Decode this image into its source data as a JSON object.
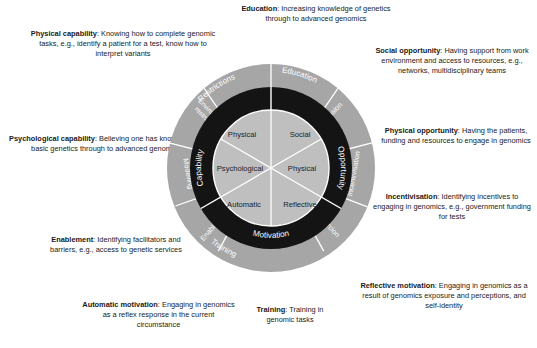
{
  "figure": {
    "colors": {
      "outer_ring": "#a6a6a6",
      "middle_ring": "#1a1a1a",
      "inner_circle": "#bfbfbf",
      "divider": "#ffffff",
      "text": "#1a1a1a",
      "ring_text": "#ffffff",
      "background": "#ffffff"
    }
  },
  "wheel": {
    "inner_circle": {
      "name": "com-b-components",
      "segments": [
        {
          "label": "Physical",
          "position": "top-left"
        },
        {
          "label": "Social",
          "position": "top-right"
        },
        {
          "label": "Psychological",
          "position": "middle-left"
        },
        {
          "label": "Physical",
          "position": "middle-right"
        },
        {
          "label": "Automatic",
          "position": "bottom-left"
        },
        {
          "label": "Reflective",
          "position": "bottom-right"
        }
      ]
    },
    "middle_ring": {
      "name": "com-b-domains",
      "segments": [
        {
          "label": "Capability",
          "position": "left"
        },
        {
          "label": "Opportunity",
          "position": "right"
        },
        {
          "label": "Motivation",
          "position": "bottom"
        }
      ]
    },
    "outer_ring": {
      "name": "intervention-functions",
      "segments": [
        {
          "label": "Restrictions",
          "position": "top-left"
        },
        {
          "label": "Education",
          "position": "top-right"
        },
        {
          "label": "Environmental restructuring",
          "position": "upper-left"
        },
        {
          "label": "Persuasion",
          "position": "upper-right"
        },
        {
          "label": "Modelling",
          "position": "left"
        },
        {
          "label": "Incentivisation",
          "position": "right"
        },
        {
          "label": "Enablement",
          "position": "lower-left"
        },
        {
          "label": "Coercion",
          "position": "lower-right"
        },
        {
          "label": "Training",
          "position": "bottom"
        }
      ]
    }
  },
  "annotations": [
    {
      "id": "physical-capability",
      "term": "Physical capability",
      "text": ": Knowing how to complete genomic tasks, e.g., identify a patient for a test, know how to interpret variants"
    },
    {
      "id": "psychological-capability",
      "term": "Psychological capability",
      "text": ": Believing one has knowledge of basic genetics through to advanced genomics"
    },
    {
      "id": "enablement",
      "term": "Enablement",
      "text": ": Identifying facilitators and barriers, e.g., access to genetic services"
    },
    {
      "id": "automatic-motivation",
      "term": "Automatic motivation",
      "text": ": Engaging in genomics as a reflex response in the current circumstance"
    },
    {
      "id": "training",
      "term": "Training",
      "text": ": Training in genomic tasks"
    },
    {
      "id": "reflective-motivation",
      "term": "Reflective motivation",
      "text": ": Engaging in genomics as a result of genomics exposure and perceptions, and self-identity"
    },
    {
      "id": "incentivisation",
      "term": "Incentivisation",
      "text": ": Identifying incentives to engaging in genomics, e.g., government funding for tests"
    },
    {
      "id": "physical-opportunity",
      "term": "Physical opportunity",
      "text": ": Having the patients, funding and resources to engage in genomics"
    },
    {
      "id": "social-opportunity",
      "term": "Social opportunity",
      "text": ": Having support from work environment and access to resources, e.g., networks, multidisciplinary teams"
    },
    {
      "id": "education",
      "term": "Education",
      "text": ": Increasing knowledge of genetics through to advanced genomics"
    }
  ]
}
